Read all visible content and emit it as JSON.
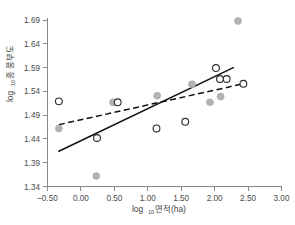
{
  "chart_data": {
    "type": "scatter",
    "title": "",
    "subtitle": "",
    "xlabel": "log₁₀면적(ha)",
    "xlabel_base": "log",
    "xlabel_sub": "10",
    "xlabel_rest": "면적(ha)",
    "ylabel": "log₁₀종 풍부도",
    "ylabel_base": "log",
    "ylabel_sub": "10",
    "ylabel_rest": "종 풍부도",
    "xlim": [
      -0.5,
      3.0
    ],
    "ylim": [
      1.34,
      1.69
    ],
    "xticks": [
      "-0.50",
      "0.00",
      "0.50",
      "1.00",
      "1.50",
      "2.00",
      "2.50",
      "3.00"
    ],
    "xtick_values": [
      -0.5,
      0.0,
      0.5,
      1.0,
      1.5,
      2.0,
      2.5,
      3.0
    ],
    "yticks": [
      "1.34",
      "1.39",
      "1.44",
      "1.49",
      "1.54",
      "1.59",
      "1.64",
      "1.69"
    ],
    "ytick_values": [
      1.34,
      1.39,
      1.44,
      1.49,
      1.54,
      1.59,
      1.64,
      1.69
    ],
    "grid": false,
    "legend": "none",
    "series": [
      {
        "name": "filled-circles",
        "marker": "filled-circle",
        "color": "#b3b3b3",
        "points": [
          {
            "x": -0.33,
            "y": 1.462
          },
          {
            "x": 0.23,
            "y": 1.362
          },
          {
            "x": 0.48,
            "y": 1.517
          },
          {
            "x": 1.14,
            "y": 1.531
          },
          {
            "x": 1.66,
            "y": 1.555
          },
          {
            "x": 1.93,
            "y": 1.517
          },
          {
            "x": 2.09,
            "y": 1.529
          },
          {
            "x": 2.35,
            "y": 1.688
          }
        ]
      },
      {
        "name": "open-circles",
        "marker": "open-circle",
        "color": "#2b2b2b",
        "points": [
          {
            "x": -0.33,
            "y": 1.519
          },
          {
            "x": 0.24,
            "y": 1.442
          },
          {
            "x": 0.55,
            "y": 1.517
          },
          {
            "x": 1.13,
            "y": 1.462
          },
          {
            "x": 1.56,
            "y": 1.476
          },
          {
            "x": 2.02,
            "y": 1.589
          },
          {
            "x": 2.08,
            "y": 1.566
          },
          {
            "x": 2.18,
            "y": 1.566
          },
          {
            "x": 2.43,
            "y": 1.556
          }
        ]
      }
    ],
    "fit_lines": [
      {
        "name": "solid-regression-line",
        "style": "solid",
        "color": "#111111",
        "x0": -0.33,
        "y0": 1.414,
        "x1": 2.28,
        "y1": 1.59
      },
      {
        "name": "dashed-regression-line",
        "style": "dashed",
        "color": "#111111",
        "x0": -0.33,
        "y0": 1.47,
        "x1": 2.43,
        "y1": 1.556
      }
    ]
  }
}
